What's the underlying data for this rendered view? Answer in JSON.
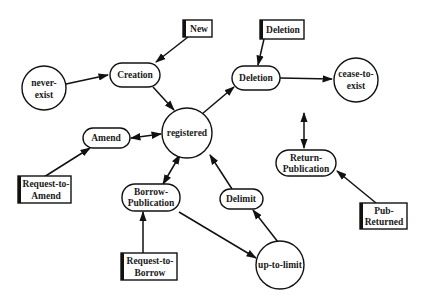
{
  "diagram": {
    "type": "state-transition",
    "states": [
      {
        "id": "never-exist",
        "lines": [
          "never-",
          "exist"
        ]
      },
      {
        "id": "registered",
        "lines": [
          "registered"
        ]
      },
      {
        "id": "cease-to-exist",
        "lines": [
          "cease-to-",
          "exist"
        ]
      },
      {
        "id": "up-to-limit",
        "lines": [
          "up-to-limit"
        ]
      }
    ],
    "operations": [
      {
        "id": "creation",
        "lines": [
          "Creation"
        ]
      },
      {
        "id": "deletion",
        "lines": [
          "Deletion"
        ]
      },
      {
        "id": "amend",
        "lines": [
          "Amend"
        ]
      },
      {
        "id": "borrow-publication",
        "lines": [
          "Borrow-",
          "Publication"
        ]
      },
      {
        "id": "delimit",
        "lines": [
          "Delimit"
        ]
      },
      {
        "id": "return-publication",
        "lines": [
          "Return-",
          "Publication"
        ]
      }
    ],
    "events": [
      {
        "id": "new",
        "lines": [
          "New"
        ]
      },
      {
        "id": "deletion-event",
        "lines": [
          "Deletion"
        ]
      },
      {
        "id": "request-to-amend",
        "lines": [
          "Request-to-",
          "Amend"
        ]
      },
      {
        "id": "request-to-borrow",
        "lines": [
          "Request-to-",
          "Borrow"
        ]
      },
      {
        "id": "pub-returned",
        "lines": [
          "Pub-",
          "Returned"
        ]
      }
    ],
    "edges": [
      {
        "from": "never-exist",
        "to": "creation",
        "type": "directed"
      },
      {
        "from": "new",
        "to": "creation",
        "type": "directed"
      },
      {
        "from": "creation",
        "to": "registered",
        "type": "directed"
      },
      {
        "from": "registered",
        "to": "deletion",
        "type": "directed"
      },
      {
        "from": "deletion-event",
        "to": "deletion",
        "type": "directed"
      },
      {
        "from": "deletion",
        "to": "cease-to-exist",
        "type": "directed"
      },
      {
        "from": "amend",
        "to": "registered",
        "type": "bidirectional"
      },
      {
        "from": "request-to-amend",
        "to": "amend",
        "type": "directed"
      },
      {
        "from": "borrow-publication",
        "to": "registered",
        "type": "bidirectional"
      },
      {
        "from": "request-to-borrow",
        "to": "borrow-publication",
        "type": "directed"
      },
      {
        "from": "borrow-publication",
        "to": "up-to-limit",
        "type": "directed"
      },
      {
        "from": "up-to-limit",
        "to": "delimit",
        "type": "directed"
      },
      {
        "from": "delimit",
        "to": "registered",
        "type": "directed"
      },
      {
        "from": "pub-returned",
        "to": "return-publication",
        "type": "directed"
      },
      {
        "from": "unlabeled",
        "to": "return-publication",
        "type": "bidirectional"
      }
    ]
  }
}
